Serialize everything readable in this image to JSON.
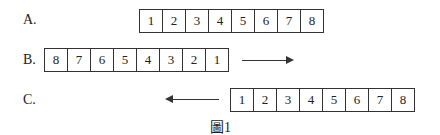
{
  "rows": [
    {
      "label": "A.",
      "cells": [
        "1",
        "2",
        "3",
        "4",
        "5",
        "6",
        "7",
        "8"
      ],
      "arrow": "none"
    },
    {
      "label": "B.",
      "cells": [
        "8",
        "7",
        "6",
        "5",
        "4",
        "3",
        "2",
        "1"
      ],
      "arrow": "right"
    },
    {
      "label": "C.",
      "cells": [
        "1",
        "2",
        "3",
        "4",
        "5",
        "6",
        "7",
        "8"
      ],
      "arrow": "left"
    }
  ],
  "caption": "圖1"
}
